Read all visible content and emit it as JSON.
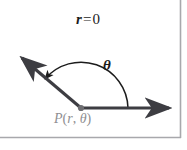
{
  "figure": {
    "width": 187,
    "height": 150,
    "background_color": "#ffffff",
    "frame": {
      "line_color": "#a8a8ac",
      "bottom_rule_y": 137,
      "right_rule_x": 180
    }
  },
  "labels": {
    "origin_label": {
      "variable": "r",
      "operator": "=",
      "value": "0",
      "full_text": "r = 0",
      "color": "#1c1c1c"
    },
    "angle_label": {
      "text": "θ",
      "name": "theta",
      "color": "#1c1c1c"
    },
    "point_label": {
      "name": "P",
      "open_paren": "(",
      "first_arg": "r",
      "comma": ",",
      "second_arg": "θ",
      "close_paren": ")",
      "full_text": "P(r, θ)",
      "color": "#8f8f92"
    }
  },
  "geometry": {
    "vertex": {
      "x": 81,
      "y": 108,
      "label": "pole",
      "dot_color": "#6e6e72"
    },
    "initial_ray": {
      "name": "initial-ray",
      "from": {
        "x": 81,
        "y": 108
      },
      "to": {
        "x": 176,
        "y": 108
      },
      "color": "#3d3d42",
      "has_arrowhead": true,
      "direction": "right"
    },
    "terminal_ray": {
      "name": "terminal-ray",
      "from": {
        "x": 81,
        "y": 108
      },
      "to": {
        "x": 17,
        "y": 54
      },
      "color": "#3d3d42",
      "has_arrowhead": true,
      "direction": "upper-left"
    },
    "angle_arc": {
      "name": "angle-arc",
      "center": {
        "x": 81,
        "y": 108
      },
      "radius": 47,
      "start_angle_deg": 0,
      "end_angle_deg": 140,
      "sweep": "counterclockwise",
      "color": "#1c1c1c",
      "arrowhead_at": "end"
    }
  }
}
